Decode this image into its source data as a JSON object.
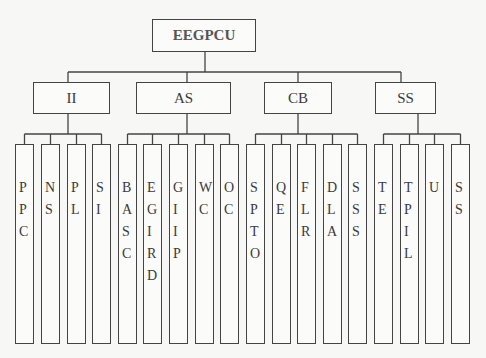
{
  "root": {
    "label": "EEGPCU"
  },
  "categories": [
    {
      "id": "ii",
      "label": "II",
      "children": [
        "PPC",
        "NS",
        "PL",
        "SI"
      ]
    },
    {
      "id": "as",
      "label": "AS",
      "children": [
        "BASC",
        "EGIRD",
        "GIIP",
        "WC",
        "OC"
      ]
    },
    {
      "id": "cb",
      "label": "CB",
      "children": [
        "SPTO",
        "QE",
        "FLR",
        "DLA",
        "SSS"
      ]
    },
    {
      "id": "ss",
      "label": "SS",
      "children": [
        "TE",
        "TPIL",
        "U",
        "SS"
      ]
    }
  ],
  "colors": {
    "line": "#444444",
    "background": "#f7f7f5",
    "box_fill": "#fbfbfa"
  }
}
